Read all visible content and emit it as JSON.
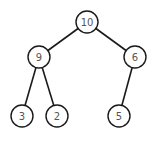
{
  "diagram": {
    "type": "binary-tree (max-heap)",
    "nodes": [
      {
        "id": "n10",
        "label": "10",
        "x": 87,
        "y": 22
      },
      {
        "id": "n9",
        "label": "9",
        "x": 39,
        "y": 57
      },
      {
        "id": "n6",
        "label": "6",
        "x": 135,
        "y": 57
      },
      {
        "id": "n3",
        "label": "3",
        "x": 22,
        "y": 116
      },
      {
        "id": "n2",
        "label": "2",
        "x": 57,
        "y": 116
      },
      {
        "id": "n5",
        "label": "5",
        "x": 119,
        "y": 116
      }
    ],
    "edges": [
      {
        "from": "n10",
        "to": "n9"
      },
      {
        "from": "n10",
        "to": "n6"
      },
      {
        "from": "n9",
        "to": "n3"
      },
      {
        "from": "n9",
        "to": "n2"
      },
      {
        "from": "n6",
        "to": "n5"
      }
    ],
    "colors": {
      "stroke": "#1a1a1a",
      "text": "#555555",
      "fill": "#ffffff"
    }
  }
}
